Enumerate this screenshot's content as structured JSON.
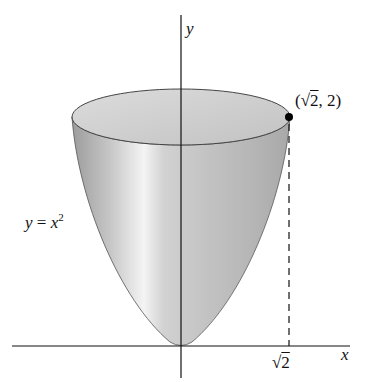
{
  "diagram": {
    "type": "paraboloid-of-revolution",
    "axes": {
      "x_label": "x",
      "y_label": "y"
    },
    "curve_label": {
      "lhs": "y",
      "eq": " = ",
      "base": "x",
      "exp": "2"
    },
    "point_label": {
      "open": "(",
      "radical": "√",
      "radicand": "2",
      "rest": ", 2)"
    },
    "tick_label": {
      "radical": "√",
      "radicand": "2"
    },
    "colors": {
      "surface_light": "#e8e8e8",
      "surface_dark": "#a9a9a9",
      "lines": "#111111"
    }
  }
}
